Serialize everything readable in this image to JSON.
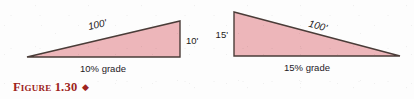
{
  "figure": {
    "caption_label": "Figure 1.30",
    "caption_diamond": "◆",
    "caption_color": "#9e2420",
    "background_color": "#fdfdfd"
  },
  "style": {
    "triangle_fill": "#edb6ba",
    "triangle_stroke": "#4a3c38",
    "label_color": "#1e1b1a"
  },
  "diagrams": [
    {
      "id": "left-triangle",
      "orientation": "ascending-right",
      "hypotenuse_label": "100'",
      "vertical_label": "10'",
      "base_label": "10% grade",
      "vertices": {
        "left_base": [
          27,
          57
        ],
        "right_base": [
          180,
          57
        ],
        "apex": [
          180,
          21
        ]
      },
      "hyp_label_pos": [
        98,
        28
      ],
      "hyp_label_rotation": -13,
      "vertical_label_pos": [
        186,
        44
      ],
      "base_label_pos": [
        103,
        72
      ]
    },
    {
      "id": "right-triangle",
      "orientation": "descending-right",
      "hypotenuse_label": "100'",
      "vertical_label": "15'",
      "base_label": "15% grade",
      "vertices": {
        "top_left": [
          234,
          12
        ],
        "left_base": [
          234,
          56
        ],
        "right_base": [
          400,
          56
        ]
      },
      "hyp_label_pos": [
        317,
        29
      ],
      "hyp_label_rotation": 15,
      "vertical_label_pos": [
        219,
        38
      ],
      "base_label_pos": [
        307,
        71
      ]
    }
  ]
}
